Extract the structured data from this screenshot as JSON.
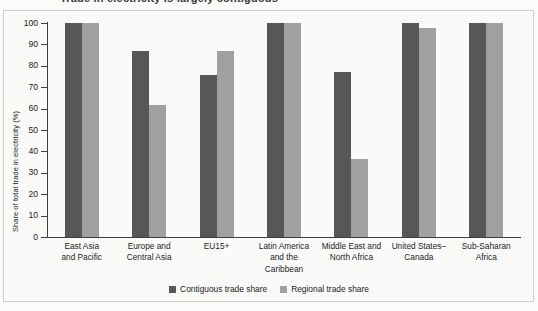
{
  "figure": {
    "clipped_title": "Trade in electricity is largely contiguous",
    "ylabel": "Share of total trade in electricity (%)"
  },
  "legend": {
    "items": [
      {
        "label": "Contiguous trade share",
        "color": "#575757",
        "swatch": "dark"
      },
      {
        "label": "Regional trade share",
        "color": "#a0a0a0",
        "swatch": "light"
      }
    ]
  },
  "yaxis": {
    "ticks": [
      "100",
      "90",
      "80",
      "70",
      "60",
      "50",
      "40",
      "30",
      "20",
      "10",
      "0"
    ]
  },
  "categories": [
    {
      "lines": [
        "East Asia",
        "and Pacific"
      ]
    },
    {
      "lines": [
        "Europe and",
        "Central Asia"
      ]
    },
    {
      "lines": [
        "EU15+"
      ]
    },
    {
      "lines": [
        "Latin America",
        "and the",
        "Caribbean"
      ]
    },
    {
      "lines": [
        "Middle East and",
        "North Africa"
      ]
    },
    {
      "lines": [
        "United States–",
        "Canada"
      ]
    },
    {
      "lines": [
        "Sub-Saharan",
        "Africa"
      ]
    }
  ],
  "chart_data": {
    "type": "bar",
    "title": "Trade in electricity is largely contiguous",
    "xlabel": "",
    "ylabel": "Share of total trade in electricity (%)",
    "ylim": [
      0,
      100
    ],
    "ytick_step": 10,
    "grid": false,
    "legend_position": "bottom-center",
    "categories": [
      "East Asia and Pacific",
      "Europe and Central Asia",
      "EU15+",
      "Latin America and the Caribbean",
      "Middle East and North Africa",
      "United States–Canada",
      "Sub-Saharan Africa"
    ],
    "series": [
      {
        "name": "Contiguous trade share",
        "color": "#575757",
        "values": [
          100,
          87,
          75.5,
          100,
          77,
          100,
          100
        ]
      },
      {
        "name": "Regional trade share",
        "color": "#a0a0a0",
        "values": [
          100,
          61.5,
          87,
          100,
          36.5,
          97.5,
          100
        ]
      }
    ]
  }
}
